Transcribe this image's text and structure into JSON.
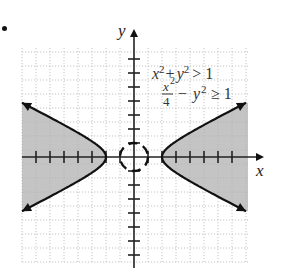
{
  "chart_data": {
    "type": "region-plot",
    "title": "",
    "xlabel": "x",
    "ylabel": "y",
    "xlim": [
      -8,
      8
    ],
    "ylim": [
      -7.5,
      7.5
    ],
    "grid": true,
    "grid_style": "dotted",
    "tick_spacing": 1,
    "legend_position": "upper right",
    "inequalities": [
      {
        "label_lhs": "x² + y²",
        "op": ">",
        "rhs": "1",
        "boundary": "circle",
        "radius": 1,
        "boundary_style": "dashed"
      },
      {
        "label_lhs": "x²/4 − y²",
        "op": "≥",
        "rhs": "1",
        "boundary": "hyperbola",
        "a": 2,
        "b": 1,
        "boundary_style": "solid"
      }
    ],
    "shaded_regions": [
      "left branch exterior x ≤ -2",
      "right branch exterior x ≥ 2"
    ],
    "shade_color": "#c4c4c4",
    "line_color": "#111111",
    "grid_color": "#b8b8b8"
  },
  "labels": {
    "x_axis": "x",
    "y_axis": "y",
    "eq1_lhs_x": "x",
    "eq1_sup": "2",
    "eq1_plus": "+",
    "eq1_y": "y",
    "eq1_rest": "> 1",
    "eq2_num": "x",
    "eq2_den": "4",
    "eq2_minus": "−",
    "eq2_y": "y",
    "eq2_rest": "≥ 1"
  }
}
